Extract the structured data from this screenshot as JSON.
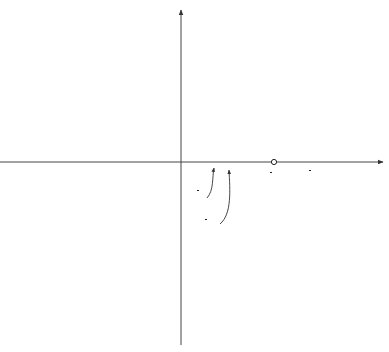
{
  "diagram": {
    "axes": {
      "x_label": "x",
      "y_label": "y",
      "origin_label": "O"
    },
    "curves": [
      {
        "name": "upper-bound",
        "label_lhs": "y = ",
        "label_var": "x",
        "label_exp": "2",
        "style": "dashed"
      },
      {
        "name": "lower-bound",
        "label_lhs": "y = −",
        "label_var": "x",
        "label_exp": "2",
        "style": "dashed"
      },
      {
        "name": "main-curve",
        "label_lhs": "y = ",
        "label_var": "x",
        "label_exp": "2",
        "label_fn": "sin",
        "label_frac_num": "1",
        "label_frac_den": "x",
        "style": "solid"
      }
    ],
    "tick_labels": [
      {
        "id": "one_over_pi",
        "num": "1",
        "den": "π"
      },
      {
        "id": "one_over_2pi",
        "num": "1",
        "den": "2π"
      },
      {
        "id": "one_over_3pi",
        "num": "1",
        "den": "3π"
      }
    ],
    "colors": {
      "curve": "#222222",
      "dashed": "#555555",
      "axis": "#444444"
    }
  }
}
